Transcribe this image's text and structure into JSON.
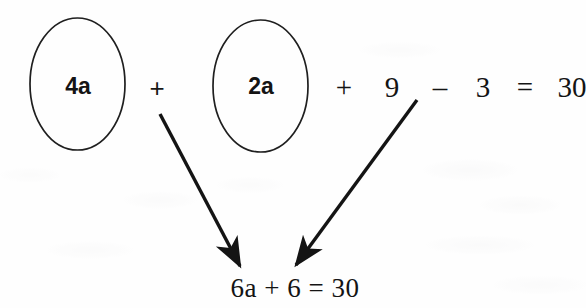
{
  "figure": {
    "type": "math-worked-example",
    "background_color": "#fefefe",
    "ink_color": "#141414"
  },
  "top_equation": {
    "full_text": "4a + 2a + 9 - 3 = 30",
    "tokens": [
      {
        "id": "term-4a",
        "text": "4a",
        "circled": true,
        "style": "sans-bold",
        "x": 78,
        "y": 86
      },
      {
        "id": "op-plus-1",
        "text": "+",
        "circled": false,
        "style": "sans",
        "x": 157,
        "y": 88
      },
      {
        "id": "term-2a",
        "text": "2a",
        "circled": true,
        "style": "sans-bold",
        "x": 261,
        "y": 86
      },
      {
        "id": "op-plus-2",
        "text": "+",
        "circled": false,
        "style": "serif",
        "x": 344,
        "y": 87
      },
      {
        "id": "num-9",
        "text": "9",
        "circled": false,
        "style": "serif",
        "x": 392,
        "y": 87
      },
      {
        "id": "op-minus",
        "text": "–",
        "circled": false,
        "style": "serif",
        "x": 440,
        "y": 87
      },
      {
        "id": "num-3",
        "text": "3",
        "circled": false,
        "style": "serif",
        "x": 483,
        "y": 87
      },
      {
        "id": "op-equals",
        "text": "=",
        "circled": false,
        "style": "serif",
        "x": 525,
        "y": 87
      },
      {
        "id": "num-30",
        "text": "30",
        "circled": false,
        "style": "serif",
        "x": 572,
        "y": 87
      }
    ]
  },
  "circles": [
    {
      "id": "circle-4a",
      "label": "4a",
      "cx": 77.5,
      "cy": 84,
      "rx": 47.5,
      "ry": 66
    },
    {
      "id": "circle-2a",
      "label": "2a",
      "cx": 260.5,
      "cy": 86,
      "rx": 47.5,
      "ry": 66
    }
  ],
  "arrows": [
    {
      "id": "arrow-left",
      "from_label": "4a",
      "to_label": "6a + 6 = 30",
      "tail": {
        "x": 160,
        "y": 114
      },
      "tip": {
        "x": 243,
        "y": 272
      }
    },
    {
      "id": "arrow-right",
      "from_label": "- 3",
      "to_label": "6a + 6 = 30",
      "tail": {
        "x": 417,
        "y": 100
      },
      "tip": {
        "x": 293,
        "y": 270
      }
    }
  ],
  "result_equation": {
    "text": "6a + 6 = 30",
    "x": 295,
    "y": 288
  }
}
